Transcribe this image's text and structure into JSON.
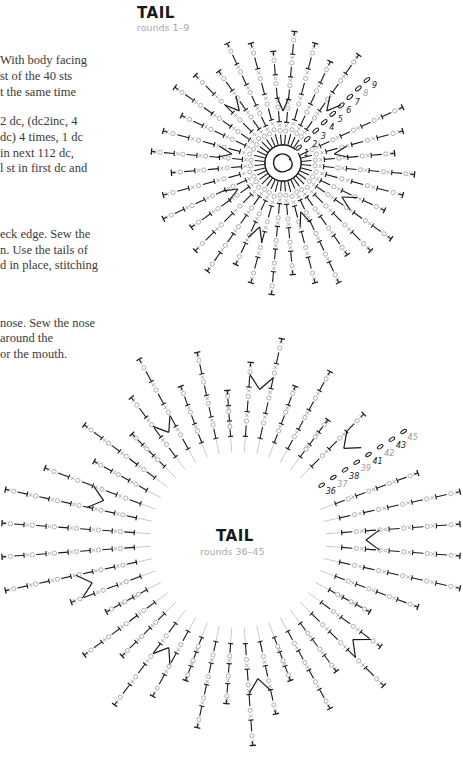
{
  "text_column": {
    "para1": [
      "With body facing",
      "st of the 40 sts",
      "t the same time"
    ],
    "para2": [
      "2 dc, (dc2inc, 4",
      "dc) 4 times, 1 dc",
      "in next 112 dc,",
      "l st in first dc and"
    ],
    "para3": [
      "eck edge. Sew the",
      "n. Use the tails of",
      "d in place, stitching"
    ],
    "para4": [
      "nose. Sew the nose",
      " around the",
      "or the mouth."
    ]
  },
  "chart_top": {
    "title": "TAIL",
    "subtitle": "rounds 1–9",
    "round_numbers": [
      "1",
      "2",
      "3",
      "4",
      "5",
      "6",
      "7",
      "8",
      "9"
    ]
  },
  "chart_bottom": {
    "title": "TAIL",
    "subtitle": "rounds 36–45",
    "round_numbers": [
      "36",
      "37",
      "38",
      "39",
      "41",
      "42",
      "43",
      "45"
    ]
  },
  "colors": {
    "ink": "#1a1a1a",
    "grey": "#9a9a9a",
    "text": "#3a3a3a"
  }
}
